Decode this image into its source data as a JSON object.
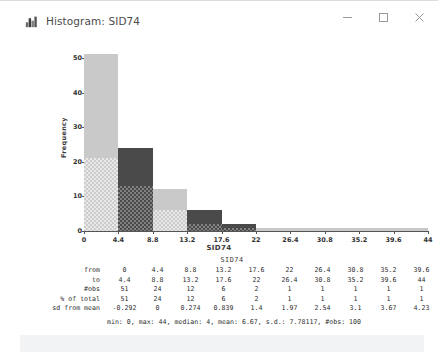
{
  "window": {
    "title": "Histogram: SID74",
    "icon": "histogram-app-icon",
    "controls": {
      "minimize": "─",
      "maximize": "□",
      "close": "✕"
    }
  },
  "chart_data": {
    "type": "bar",
    "title": "",
    "xlabel": "SID74",
    "ylabel": "Frequency",
    "categories": [
      "0",
      "4.4",
      "8.8",
      "13.2",
      "17.6",
      "22",
      "26.4",
      "30.8",
      "35.2",
      "39.6"
    ],
    "values": [
      51,
      24,
      12,
      6,
      2,
      1,
      1,
      1,
      1,
      1
    ],
    "bin_from": [
      "0",
      "4.4",
      "8.8",
      "13.2",
      "17.6",
      "22",
      "26.4",
      "30.8",
      "35.2",
      "39.6"
    ],
    "bin_to": [
      "4.4",
      "8.8",
      "13.2",
      "17.6",
      "22",
      "26.4",
      "30.8",
      "35.2",
      "39.6",
      "44"
    ],
    "x_ticks": [
      "0",
      "4.4",
      "8.8",
      "13.2",
      "17.6",
      "22",
      "26.4",
      "30.8",
      "35.2",
      "39.6",
      "44"
    ],
    "y_ticks": [
      "0",
      "10",
      "20",
      "30",
      "40",
      "50"
    ],
    "xlim": [
      0,
      44
    ],
    "ylim": [
      0,
      51
    ],
    "grid": false,
    "legend": "none",
    "bar_fill_light": "#c9c9c9",
    "bar_fill_dark": "#4a4a4a",
    "axis_color": "#555555",
    "selected_counts": [
      21,
      13,
      6,
      2,
      1,
      0,
      0,
      0,
      0,
      0
    ]
  },
  "stats": {
    "title": "SID74",
    "rows": [
      {
        "label": "from",
        "values": [
          "0",
          "4.4",
          "8.8",
          "13.2",
          "17.6",
          "22",
          "26.4",
          "30.8",
          "35.2",
          "39.6"
        ]
      },
      {
        "label": "to",
        "values": [
          "4.4",
          "8.8",
          "13.2",
          "17.6",
          "22",
          "26.4",
          "30.8",
          "35.2",
          "39.6",
          "44"
        ]
      },
      {
        "label": "#obs",
        "values": [
          "51",
          "24",
          "12",
          "6",
          "2",
          "1",
          "1",
          "1",
          "1",
          "1"
        ]
      },
      {
        "label": "% of total",
        "values": [
          "51",
          "24",
          "12",
          "6",
          "2",
          "1",
          "1",
          "1",
          "1",
          "1"
        ]
      },
      {
        "label": "sd from mean",
        "values": [
          "-0.292",
          "0",
          "0.274",
          "0.839",
          "1.4",
          "1.97",
          "2.54",
          "3.1",
          "3.67",
          "4.23"
        ]
      }
    ],
    "summary": "min: 0, max: 44, median: 4, mean: 6.67, s.d.: 7.78117, #obs: 100"
  }
}
